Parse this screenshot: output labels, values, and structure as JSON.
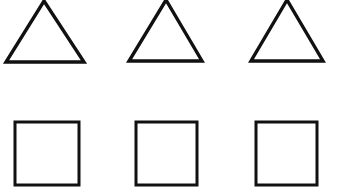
{
  "figure": {
    "width": 338,
    "height": 190,
    "background_color": "#ffffff",
    "stroke_color": "#111111",
    "fill_color": "#ffffff"
  },
  "rows": [
    {
      "name": "triangle-row",
      "shape_type": "triangle",
      "count": 3,
      "label": "Row 1: three triangles"
    },
    {
      "name": "square-row",
      "shape_type": "square",
      "count": 3,
      "label": "Row 2: three squares"
    }
  ],
  "shapes": [
    {
      "id": "triangle-1",
      "type": "triangle",
      "row": 0,
      "column": 0,
      "points": "44,1 84,62 6,62",
      "stroke_width": 3.4,
      "clipped_top": true
    },
    {
      "id": "triangle-2",
      "type": "triangle",
      "row": 0,
      "column": 1,
      "points": "166,0 202,61 129,61",
      "stroke_width": 3.4,
      "clipped_top": true
    },
    {
      "id": "triangle-3",
      "type": "triangle",
      "row": 0,
      "column": 2,
      "points": "287,0 323,61 251,61",
      "stroke_width": 3.4,
      "clipped_top": true
    },
    {
      "id": "square-1",
      "type": "square",
      "row": 1,
      "column": 0,
      "x": 15,
      "y": 122,
      "width": 64,
      "height": 63,
      "stroke_width": 3.0
    },
    {
      "id": "square-2",
      "type": "square",
      "row": 1,
      "column": 1,
      "x": 136,
      "y": 122,
      "width": 61,
      "height": 63,
      "stroke_width": 3.0
    },
    {
      "id": "square-3",
      "type": "square",
      "row": 1,
      "column": 2,
      "x": 256,
      "y": 122,
      "width": 61,
      "height": 63,
      "stroke_width": 3.0
    }
  ]
}
